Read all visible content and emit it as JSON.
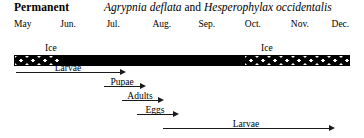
{
  "header": {
    "habitat": "Permanent",
    "species_a": "Agrypnia deflata",
    "conjunction": " and ",
    "species_b": "Hesperophylax occidentalis"
  },
  "axis": {
    "months": [
      {
        "label": "May",
        "left_pct": 0.0
      },
      {
        "label": "Jun.",
        "left_pct": 13.8
      },
      {
        "label": "Jul.",
        "left_pct": 27.5
      },
      {
        "label": "Aug.",
        "left_pct": 41.2
      },
      {
        "label": "Sep.",
        "left_pct": 54.9
      },
      {
        "label": "Oct.",
        "left_pct": 68.7
      },
      {
        "label": "Nov.",
        "left_pct": 82.4
      },
      {
        "label": "Dec.",
        "left_pct": 94.5
      }
    ]
  },
  "bar": {
    "segments": [
      {
        "name": "ice-left",
        "pattern": "stipple",
        "left_pct": 0.0,
        "width_pct": 13.8
      },
      {
        "name": "open-water",
        "pattern": "solid",
        "left_pct": 13.8,
        "width_pct": 55.2
      },
      {
        "name": "ice-right",
        "pattern": "stipple",
        "left_pct": 69.0,
        "width_pct": 31.0
      }
    ],
    "labels": [
      {
        "text": "Ice",
        "left_px": 45,
        "top_px": 43
      },
      {
        "text": "Ice",
        "left_px": 261,
        "top_px": 43
      }
    ]
  },
  "stages": [
    {
      "label": "Larvae",
      "top_px": 68,
      "left_px": 16,
      "width_px": 110
    },
    {
      "label": "Pupae",
      "top_px": 82,
      "left_px": 104,
      "width_px": 42
    },
    {
      "label": "Adults",
      "top_px": 96,
      "left_px": 122,
      "width_px": 42
    },
    {
      "label": "Eggs",
      "top_px": 110,
      "left_px": 137,
      "width_px": 42
    },
    {
      "label": "Larvae",
      "top_px": 124,
      "left_px": 163,
      "width_px": 172
    }
  ],
  "colors": {
    "background": "#ffffff",
    "ink": "#000000",
    "arrow": "#1a1a1a"
  }
}
